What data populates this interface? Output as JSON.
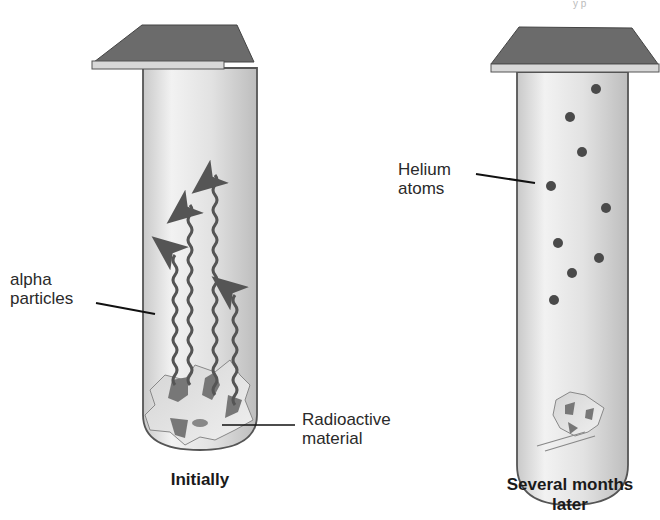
{
  "diagram": {
    "title_fragment": "y p",
    "left_tube": {
      "caption": "Initially",
      "labels": {
        "alpha_line1": "alpha",
        "alpha_line2": "particles",
        "material_line1": "Radioactive",
        "material_line2": "material"
      },
      "arrow_count": 4
    },
    "right_tube": {
      "caption_line1": "Several months",
      "caption_line2": "later",
      "labels": {
        "helium_line1": "Helium",
        "helium_line2": "atoms"
      },
      "helium_atom_count": 9
    },
    "colors": {
      "cap_top": "#6b6b6b",
      "cap_rim": "#d8d8d8",
      "tube_fill": "#e4e4e4",
      "tube_edge": "#555555",
      "particle": "#555555",
      "atom": "#4a4a4a"
    }
  }
}
